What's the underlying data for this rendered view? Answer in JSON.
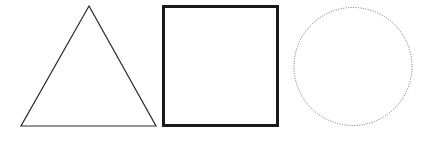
{
  "canvas": {
    "width": 426,
    "height": 144,
    "background": "#ffffff"
  },
  "shapes": [
    {
      "type": "triangle",
      "points": "89,6 21,126 156,126",
      "stroke": "#2a2a2a",
      "stroke_width": "1.2",
      "fill": "none",
      "style": "solid"
    },
    {
      "type": "square",
      "x": "163.5",
      "y": "6.5",
      "width": "114",
      "height": "119",
      "stroke": "#1a1a1a",
      "stroke_width": "3",
      "fill": "none",
      "style": "solid"
    },
    {
      "type": "circle",
      "cx": "353",
      "cy": "66.5",
      "r": "59",
      "stroke": "#6a6a6a",
      "stroke_width": "1",
      "stroke_dasharray": "1,1.5",
      "fill": "none",
      "style": "dotted"
    }
  ]
}
